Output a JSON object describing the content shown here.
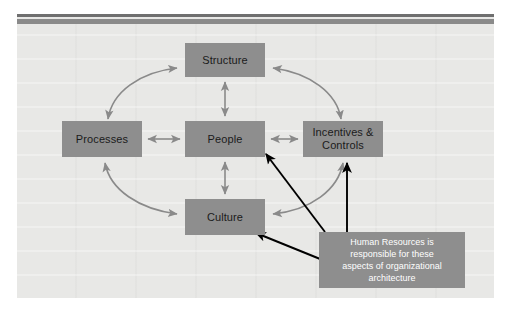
{
  "diagram": {
    "title": "Organizational Architecture",
    "nodes": [
      {
        "id": "structure",
        "label": "Structure"
      },
      {
        "id": "processes",
        "label": "Processes"
      },
      {
        "id": "people",
        "label": "People"
      },
      {
        "id": "incentives",
        "label": "Incentives &\nControls"
      },
      {
        "id": "culture",
        "label": "Culture"
      }
    ],
    "node_labels": {
      "structure": "Structure",
      "processes": "Processes",
      "people": "People",
      "incentives_line1": "Incentives &",
      "incentives_line2": "Controls",
      "culture": "Culture"
    },
    "callout": {
      "line1": "Human Resources is",
      "line2": "responsible for these",
      "line3": "aspects of organizational",
      "line4": "architecture"
    },
    "connections": [
      {
        "from": "people",
        "to": "structure",
        "style": "straight",
        "heads": "both"
      },
      {
        "from": "people",
        "to": "culture",
        "style": "straight",
        "heads": "both"
      },
      {
        "from": "people",
        "to": "processes",
        "style": "straight",
        "heads": "both"
      },
      {
        "from": "people",
        "to": "incentives",
        "style": "straight",
        "heads": "both"
      },
      {
        "from": "processes",
        "to": "structure",
        "style": "curved",
        "heads": "both"
      },
      {
        "from": "structure",
        "to": "incentives",
        "style": "curved",
        "heads": "both"
      },
      {
        "from": "processes",
        "to": "culture",
        "style": "curved",
        "heads": "both"
      },
      {
        "from": "culture",
        "to": "incentives",
        "style": "curved",
        "heads": "both"
      }
    ],
    "callout_pointers": [
      {
        "to": "people",
        "color": "#000000"
      },
      {
        "to": "culture",
        "color": "#000000"
      },
      {
        "to": "incentives",
        "color": "#000000"
      }
    ],
    "colors": {
      "canvas": "#e8e8e6",
      "node_fill": "#8e8e8e",
      "node_text": "#1b1b1b",
      "callout_fill": "#8e8e8e",
      "callout_text": "#ffffff",
      "arrow_gray": "#8a8a8a",
      "arrow_black": "#000000",
      "rule_dark": "#6f6f6f",
      "rule_light": "#8a8a8a"
    }
  }
}
